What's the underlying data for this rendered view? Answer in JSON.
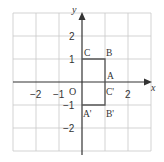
{
  "diagram": {
    "axes": {
      "x_label": "x",
      "y_label": "y",
      "origin_label": "O"
    },
    "x_ticks": [
      {
        "value": -2,
        "label": "−2"
      },
      {
        "value": -1,
        "label": "−1"
      },
      {
        "value": 2,
        "label": "2"
      }
    ],
    "y_ticks": [
      {
        "value": 2,
        "label": "2"
      },
      {
        "value": 1,
        "label": "1"
      },
      {
        "value": -1,
        "label": "−1"
      },
      {
        "value": -2,
        "label": "−2"
      }
    ],
    "grid_range": [
      -3,
      3
    ],
    "shapes": [
      {
        "name": "rectangle-CBAO",
        "points": [
          [
            0,
            0
          ],
          [
            0,
            1
          ],
          [
            1,
            1
          ],
          [
            1,
            0
          ]
        ]
      },
      {
        "name": "rectangle-A'B'C'O",
        "points": [
          [
            0,
            0
          ],
          [
            0,
            -1
          ],
          [
            1,
            -1
          ],
          [
            1,
            0
          ]
        ]
      }
    ],
    "point_labels": [
      {
        "label": "C",
        "x": 0,
        "y": 1
      },
      {
        "label": "B",
        "x": 1,
        "y": 1
      },
      {
        "label": "A",
        "x": 1,
        "y": 0
      },
      {
        "label": "C'",
        "x": 1,
        "y": 0
      },
      {
        "label": "A'",
        "x": 0,
        "y": -1
      },
      {
        "label": "B'",
        "x": 1,
        "y": -1
      }
    ],
    "colors": {
      "grid": "#c8c8c8",
      "axis": "#333333",
      "shape": "#555555"
    }
  }
}
